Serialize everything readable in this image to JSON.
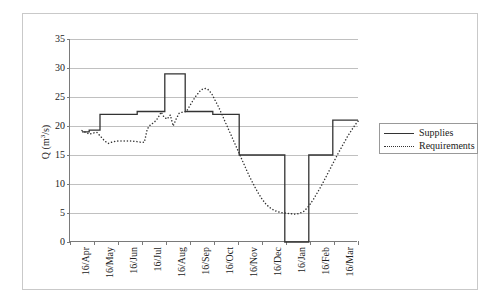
{
  "chart_data": {
    "type": "line",
    "title": "",
    "xlabel": "",
    "ylabel": "Q (m3/s)",
    "ylabel_base": "Q (m",
    "ylabel_sup": "3",
    "ylabel_tail": "/s)",
    "ylim": [
      0,
      35
    ],
    "yticks": [
      0,
      5,
      10,
      15,
      20,
      25,
      30,
      35
    ],
    "ytick_labels": [
      "0",
      "5",
      "10",
      "15",
      "20",
      "25",
      "30",
      "35"
    ],
    "grid": true,
    "grid_axis": "y",
    "categories": [
      "16/Apr",
      "16/May",
      "16/Jun",
      "16/Jul",
      "16/Aug",
      "16/Sep",
      "16/Oct",
      "16/Nov",
      "16/Dec",
      "16/Jan",
      "16/Feb",
      "16/Mar"
    ],
    "legend_position": "right",
    "series": [
      {
        "name": "Supplies",
        "style": "solid",
        "color": "#333333",
        "step": true,
        "values": [
          19.0,
          19.0,
          22.0,
          22.0,
          22.5,
          29.0,
          22.5,
          22.0,
          15.0,
          0.0,
          15.0,
          21.0
        ],
        "step_points": [
          [
            0.0,
            19.0
          ],
          [
            0.3,
            19.0
          ],
          [
            0.3,
            19.3
          ],
          [
            0.75,
            19.3
          ],
          [
            0.75,
            22.0
          ],
          [
            1.55,
            22.0
          ],
          [
            1.55,
            22.0
          ],
          [
            2.3,
            22.0
          ],
          [
            2.3,
            22.5
          ],
          [
            3.45,
            22.5
          ],
          [
            3.45,
            29.0
          ],
          [
            4.3,
            29.0
          ],
          [
            4.3,
            22.5
          ],
          [
            5.45,
            22.5
          ],
          [
            5.45,
            22.0
          ],
          [
            6.55,
            22.0
          ],
          [
            6.55,
            15.0
          ],
          [
            8.45,
            15.0
          ],
          [
            8.45,
            0.0
          ],
          [
            9.45,
            0.0
          ],
          [
            9.45,
            15.0
          ],
          [
            10.45,
            15.0
          ],
          [
            10.45,
            21.0
          ],
          [
            11.5,
            21.0
          ]
        ]
      },
      {
        "name": "Requirements",
        "style": "dotted",
        "color": "#333333",
        "step": false,
        "values": [
          19.0,
          18.8,
          17.0,
          17.3,
          20.5,
          26.5,
          22.0,
          7.5,
          5.0,
          5.2,
          14.0,
          21.0
        ],
        "points": [
          [
            0.0,
            19.2
          ],
          [
            0.15,
            18.9
          ],
          [
            0.32,
            18.6
          ],
          [
            0.48,
            18.8
          ],
          [
            0.62,
            18.9
          ],
          [
            0.8,
            18.1
          ],
          [
            0.95,
            17.4
          ],
          [
            1.1,
            17.0
          ],
          [
            1.3,
            17.3
          ],
          [
            1.5,
            17.4
          ],
          [
            1.7,
            17.4
          ],
          [
            1.9,
            17.4
          ],
          [
            2.1,
            17.4
          ],
          [
            2.3,
            17.3
          ],
          [
            2.45,
            17.2
          ],
          [
            2.6,
            17.2
          ],
          [
            2.72,
            19.5
          ],
          [
            2.85,
            20.2
          ],
          [
            3.0,
            20.6
          ],
          [
            3.15,
            21.3
          ],
          [
            3.3,
            22.4
          ],
          [
            3.42,
            21.5
          ],
          [
            3.55,
            21.2
          ],
          [
            3.68,
            21.9
          ],
          [
            3.8,
            20.0
          ],
          [
            3.92,
            21.2
          ],
          [
            4.05,
            22.2
          ],
          [
            4.2,
            22.4
          ],
          [
            4.35,
            22.5
          ],
          [
            4.55,
            23.9
          ],
          [
            4.75,
            25.2
          ],
          [
            4.95,
            26.2
          ],
          [
            5.1,
            26.5
          ],
          [
            5.25,
            26.3
          ],
          [
            5.4,
            25.6
          ],
          [
            5.55,
            24.4
          ],
          [
            5.7,
            23.2
          ],
          [
            5.85,
            21.8
          ],
          [
            6.0,
            20.4
          ],
          [
            6.15,
            19.0
          ],
          [
            6.3,
            17.6
          ],
          [
            6.45,
            16.2
          ],
          [
            6.6,
            14.8
          ],
          [
            6.75,
            13.4
          ],
          [
            6.9,
            12.0
          ],
          [
            7.05,
            10.7
          ],
          [
            7.2,
            9.5
          ],
          [
            7.35,
            8.4
          ],
          [
            7.5,
            7.4
          ],
          [
            7.65,
            6.6
          ],
          [
            7.8,
            6.0
          ],
          [
            7.95,
            5.6
          ],
          [
            8.1,
            5.3
          ],
          [
            8.25,
            5.1
          ],
          [
            8.45,
            5.0
          ],
          [
            8.65,
            4.9
          ],
          [
            8.85,
            4.8
          ],
          [
            9.05,
            4.9
          ],
          [
            9.25,
            5.3
          ],
          [
            9.45,
            6.2
          ],
          [
            9.65,
            7.4
          ],
          [
            9.85,
            8.8
          ],
          [
            10.05,
            10.3
          ],
          [
            10.25,
            11.9
          ],
          [
            10.45,
            13.5
          ],
          [
            10.65,
            15.1
          ],
          [
            10.85,
            16.6
          ],
          [
            11.05,
            18.1
          ],
          [
            11.25,
            19.4
          ],
          [
            11.45,
            20.6
          ],
          [
            11.55,
            21.0
          ]
        ]
      }
    ]
  },
  "legend": {
    "items": [
      {
        "label": "Supplies",
        "style": "solid"
      },
      {
        "label": "Requirements",
        "style": "dotted"
      }
    ]
  }
}
